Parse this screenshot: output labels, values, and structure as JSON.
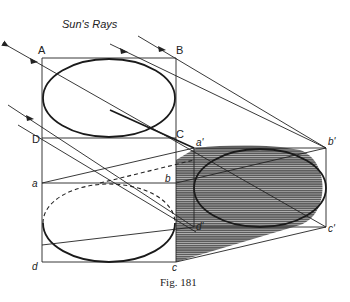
{
  "figure": {
    "title": "Sun's Rays",
    "caption": "Fig. 181",
    "labels": {
      "A": "A",
      "B": "B",
      "C": "C",
      "D": "D",
      "a": "a",
      "b": "b",
      "c": "c",
      "d": "d",
      "a_prime": "a'",
      "b_prime": "b'",
      "c_prime": "c'",
      "d_prime": "d'"
    }
  }
}
